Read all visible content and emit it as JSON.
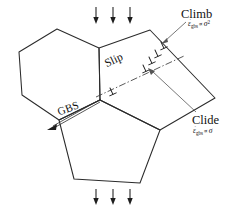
{
  "diagram": {
    "background_color": "#ffffff",
    "line_color": "#2b2b2b",
    "labels": {
      "slip": "Slip",
      "gbs": "GBS",
      "climb": "Climb",
      "glide": "Clide"
    },
    "formulas": {
      "climb": {
        "symbol": "ε",
        "dot": "˙",
        "subscript": "gbs",
        "proportional": "∝",
        "stress": "σ",
        "exponent": "2"
      },
      "glide": {
        "symbol": "ε",
        "dot": "˙",
        "subscript": "gbs",
        "proportional": "∝",
        "stress": "σ",
        "exponent": ""
      }
    },
    "load": {
      "top_arrow_count": 3,
      "bottom_arrow_count": 3,
      "direction": "down"
    },
    "dislocations": {
      "symbol": "⊥",
      "count": 5,
      "location": "slip-plane-pileup"
    },
    "grains": [
      {
        "name": "left-grain",
        "shape": "hexagon"
      },
      {
        "name": "right-grain",
        "shape": "quadrilateral"
      },
      {
        "name": "bottom-grain",
        "shape": "pentagon"
      }
    ]
  }
}
